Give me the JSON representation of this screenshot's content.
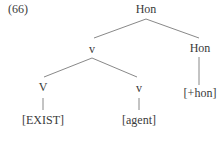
{
  "example_number": "(66)",
  "tree": {
    "root": {
      "label": "Hon"
    },
    "v_node": {
      "label": "v"
    },
    "hon_node": {
      "label": "Hon"
    },
    "hon_feature": {
      "label": "[+hon]"
    },
    "V_node": {
      "label": "V"
    },
    "v_lower_node": {
      "label": "v"
    },
    "exist_feature": {
      "label": "[EXIST]"
    },
    "agent_feature": {
      "label": "[agent]"
    }
  },
  "colors": {
    "line": "#7a7a7a",
    "text": "#3a3a3a"
  }
}
